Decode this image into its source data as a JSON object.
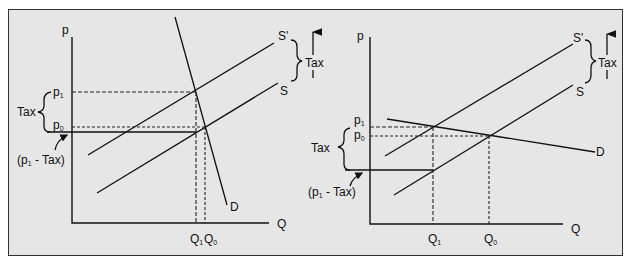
{
  "colors": {
    "background": "#e6e6e6",
    "line": "#111111",
    "frame_border": "#333333"
  },
  "panels": [
    {
      "name": "inelastic-demand",
      "y_axis_label": "p",
      "x_axis_label": "Q",
      "price_labels": {
        "p1": "p",
        "p1_sub": "1",
        "p0": "p",
        "p0_sub": "0"
      },
      "qty_labels": {
        "q1": "Q",
        "q1_sub": "1",
        "q0": "Q",
        "q0_sub": "0"
      },
      "curve_labels": {
        "supply_shifted": "S'",
        "supply": "S",
        "demand": "D"
      },
      "tax_brace_label": "Tax",
      "tax_shift_label": "Tax",
      "net_price_label": {
        "open": "(p",
        "sub": "1",
        "close": " - Tax)"
      }
    },
    {
      "name": "elastic-demand",
      "y_axis_label": "p",
      "x_axis_label": "Q",
      "price_labels": {
        "p1": "p",
        "p1_sub": "1",
        "p0": "p",
        "p0_sub": "0"
      },
      "qty_labels": {
        "q1": "Q",
        "q1_sub": "1",
        "q0": "Q",
        "q0_sub": "0"
      },
      "curve_labels": {
        "supply_shifted": "S'",
        "supply": "S",
        "demand": "D"
      },
      "tax_brace_label": "Tax",
      "tax_shift_label": "Tax",
      "net_price_label": {
        "open": "(p",
        "sub": "1",
        "close": " - Tax)"
      }
    }
  ]
}
